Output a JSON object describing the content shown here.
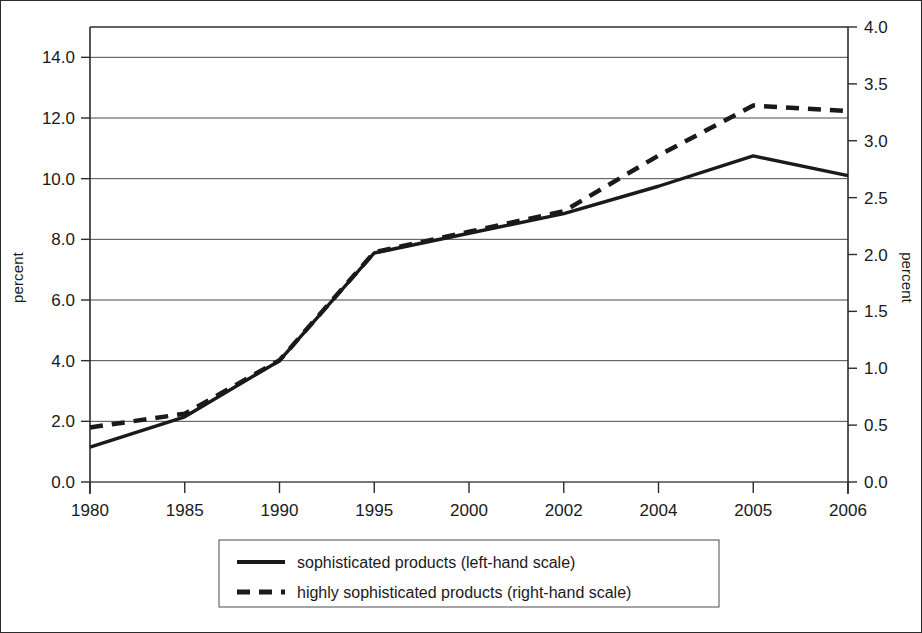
{
  "chart_data": {
    "type": "line",
    "title": "",
    "subtitle": "",
    "xlabel": "",
    "ylabel": "percent",
    "ylabel_right": "percent",
    "grid": true,
    "legend_position": "bottom",
    "categories": [
      "1980",
      "1985",
      "1990",
      "1995",
      "2000",
      "2002",
      "2004",
      "2005",
      "2006"
    ],
    "x_tick_labels": [
      "1980",
      "1985",
      "1990",
      "1995",
      "2000",
      "2002",
      "2004",
      "2005",
      "2006"
    ],
    "y_tick_labels_left": [
      "0.0",
      "2.0",
      "4.0",
      "6.0",
      "8.0",
      "10.0",
      "12.0",
      "14.0"
    ],
    "y_tick_values_left": [
      0.0,
      2.0,
      4.0,
      6.0,
      8.0,
      10.0,
      12.0,
      14.0
    ],
    "ylim_left": [
      0.0,
      15.0
    ],
    "y_tick_labels_right": [
      "0.0",
      "0.5",
      "1.0",
      "1.5",
      "2.0",
      "2.5",
      "3.0",
      "3.5",
      "4.0"
    ],
    "y_tick_values_right": [
      0.0,
      0.5,
      1.0,
      1.5,
      2.0,
      2.5,
      3.0,
      3.5,
      4.0
    ],
    "ylim_right": [
      0.0,
      4.0
    ],
    "series": [
      {
        "name": "sophisticated products (left-hand scale)",
        "axis": "left",
        "style": "solid",
        "color": "#1a1a1a",
        "values": [
          1.15,
          2.15,
          4.0,
          7.55,
          8.2,
          8.85,
          9.75,
          10.75,
          10.1
        ]
      },
      {
        "name": "highly sophisticated products (right-hand scale)",
        "axis": "right",
        "style": "dashed",
        "color": "#1a1a1a",
        "values": [
          0.48,
          0.6,
          1.07,
          2.02,
          2.2,
          2.38,
          2.87,
          3.31,
          3.26
        ]
      }
    ],
    "legend": [
      {
        "label": "sophisticated products (left-hand scale)",
        "style": "solid"
      },
      {
        "label": "highly sophisticated products (right-hand scale)",
        "style": "dashed"
      }
    ]
  }
}
